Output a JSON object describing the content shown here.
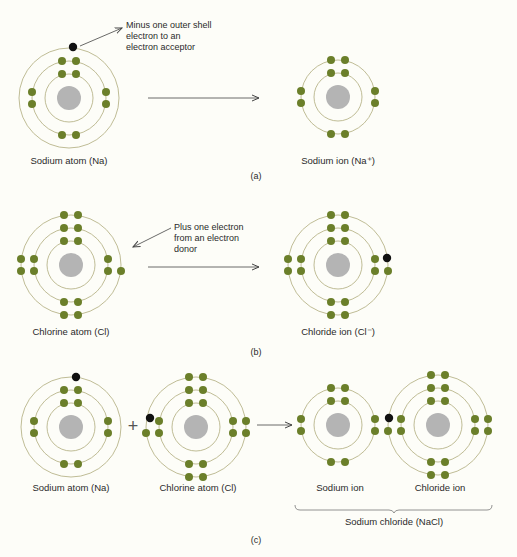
{
  "colors": {
    "background": "#fdfdf8",
    "shell": "#b8b48a",
    "nucleus": "#b4b4b4",
    "electron": "#6b7f2a",
    "transferred_electron": "#111111",
    "arrow": "#444444",
    "text": "#2a2a2a"
  },
  "panels": [
    {
      "id": "a",
      "part_label": "(a)",
      "annotation": [
        "Minus one outer shell",
        "electron to an",
        "electron acceptor"
      ],
      "left_label": "Sodium atom (Na)",
      "right_label": "Sodium ion (Na⁺)"
    },
    {
      "id": "b",
      "part_label": "(b)",
      "annotation": [
        "Plus one electron",
        "from an electron",
        "donor"
      ],
      "left_label": "Chlorine atom (Cl)",
      "right_label": "Chloride ion (Cl⁻)"
    },
    {
      "id": "c",
      "part_label": "(c)",
      "labels": [
        "Sodium atom (Na)",
        "Chlorine atom (Cl)",
        "Sodium ion",
        "Chloride ion"
      ],
      "plus_sign": "+",
      "compound_label": "Sodium chloride (NaCl)"
    }
  ],
  "atoms": [
    {
      "name": "sodium-atom-a",
      "cx": 69,
      "cy": 98,
      "shells": 3,
      "electrons": "na",
      "extra": {
        "x": 73,
        "y": 47
      }
    },
    {
      "name": "sodium-ion-a",
      "cx": 338,
      "cy": 97,
      "shells": 2,
      "electrons": "na_ion"
    },
    {
      "name": "chlorine-atom-b",
      "cx": 71,
      "cy": 265,
      "shells": 3,
      "electrons": "cl_atom"
    },
    {
      "name": "chloride-ion-b",
      "cx": 338,
      "cy": 265,
      "shells": 3,
      "electrons": "cl_ion",
      "extra": {
        "x": 387,
        "y": 258
      }
    },
    {
      "name": "sodium-atom-c",
      "cx": 71,
      "cy": 427,
      "shells": 3,
      "electrons": "na",
      "extra": {
        "x": 76,
        "y": 377
      }
    },
    {
      "name": "chlorine-atom-c",
      "cx": 196,
      "cy": 427,
      "shells": 3,
      "electrons": "cl_atom_left",
      "extra": {
        "x": 150,
        "y": 418
      }
    },
    {
      "name": "sodium-ion-c",
      "cx": 338,
      "cy": 425,
      "shells": 2,
      "electrons": "na_ion"
    },
    {
      "name": "chloride-ion-c",
      "cx": 438,
      "cy": 425,
      "shells": 3,
      "electrons": "cl_ion_left",
      "extra": {
        "x": 389,
        "y": 418
      }
    }
  ]
}
